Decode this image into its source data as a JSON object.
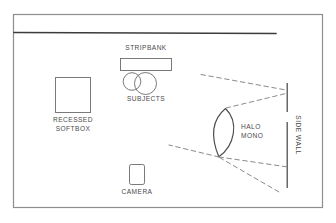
{
  "diagram": {
    "type": "floor-plan",
    "line_color": "#5a5a5a",
    "text_color": "#4a4a4a",
    "background_color": "#ffffff",
    "frame": {
      "x": 13,
      "y": 14,
      "width": 310,
      "height": 194
    },
    "back_wall": {
      "x1": 14,
      "y1": 32,
      "x2": 276,
      "y2": 33
    },
    "labels": {
      "stripbank": "STRIPBANK",
      "subjects": "SUBJECTS",
      "recessed_softbox": "RECESSED\nSOFTBOX",
      "recessed_softbox_line1": "RECESSED",
      "recessed_softbox_line2": "SOFTBOX",
      "camera": "CAMERA",
      "halo_mono_line1": "HALO",
      "halo_mono_line2": "MONO",
      "side_wall": "SIDE WALL"
    },
    "elements": [
      {
        "name": "stripbank",
        "shape": "rectangle",
        "x": 120,
        "y": 58,
        "width": 52,
        "height": 13
      },
      {
        "name": "subject-left",
        "shape": "circle",
        "cx": 132,
        "cy": 81,
        "r": 9
      },
      {
        "name": "subject-right",
        "shape": "circle",
        "cx": 145,
        "cy": 83,
        "r": 11
      },
      {
        "name": "recessed-softbox",
        "shape": "rectangle",
        "x": 55,
        "y": 77,
        "width": 36,
        "height": 36
      },
      {
        "name": "camera",
        "shape": "rounded-rectangle",
        "x": 129,
        "y": 164,
        "width": 16,
        "height": 21
      },
      {
        "name": "halo-mono",
        "shape": "lens-petal",
        "tip_top": [
          225,
          108
        ],
        "tip_bottom": [
          219,
          157
        ]
      },
      {
        "name": "side-wall-upper",
        "shape": "line",
        "x1": 287,
        "y1": 83,
        "x2": 287,
        "y2": 112
      },
      {
        "name": "side-wall-lower",
        "shape": "line",
        "x1": 287,
        "y1": 122,
        "x2": 287,
        "y2": 188
      }
    ],
    "light_beams": [
      {
        "name": "beam-upper-outer",
        "from": [
          202,
          75
        ],
        "to": [
          286,
          90
        ]
      },
      {
        "name": "beam-upper-inner",
        "from": [
          225,
          108
        ],
        "to": [
          286,
          93
        ]
      },
      {
        "name": "beam-lower-upper",
        "from": [
          219,
          157
        ],
        "to": [
          170,
          145
        ]
      },
      {
        "name": "beam-lower-middle",
        "from": [
          219,
          157
        ],
        "to": [
          288,
          167
        ]
      },
      {
        "name": "beam-lower-outer",
        "from": [
          219,
          157
        ],
        "to": [
          279,
          192
        ]
      }
    ]
  }
}
